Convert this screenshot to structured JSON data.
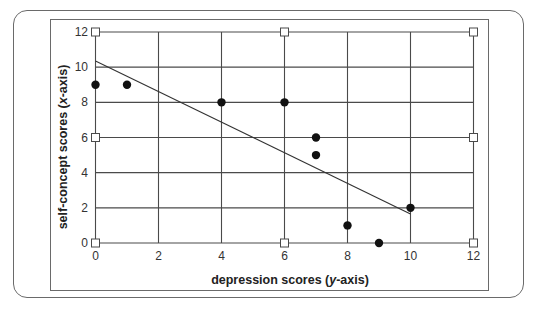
{
  "chart_data": {
    "type": "scatter",
    "title": "",
    "xlabel": "depression scores (y-axis)",
    "xlabel_parts": {
      "pre": "depression scores (",
      "italic": "y",
      "post": "-axis)"
    },
    "ylabel": "self-concept scores (x-axis)",
    "ylabel_parts": {
      "pre": "self-concept scores (",
      "italic": "x",
      "post": "-axis)"
    },
    "xlim": [
      0,
      12
    ],
    "ylim": [
      0,
      12
    ],
    "xticks": [
      0,
      2,
      4,
      6,
      8,
      10,
      12
    ],
    "yticks": [
      0,
      2,
      4,
      6,
      8,
      10,
      12
    ],
    "grid": true,
    "points": [
      {
        "x": 0,
        "y": 9
      },
      {
        "x": 1,
        "y": 9
      },
      {
        "x": 4,
        "y": 8
      },
      {
        "x": 6,
        "y": 8
      },
      {
        "x": 7,
        "y": 6
      },
      {
        "x": 7,
        "y": 5
      },
      {
        "x": 8,
        "y": 1
      },
      {
        "x": 9,
        "y": 0
      },
      {
        "x": 10,
        "y": 2
      }
    ],
    "regression_line": {
      "x1": 0,
      "y1": 10.35,
      "x2": 10,
      "y2": 1.65
    },
    "square_markers": [
      {
        "x": 0,
        "y": 0
      },
      {
        "x": 6,
        "y": 0
      },
      {
        "x": 12,
        "y": 0
      },
      {
        "x": 0,
        "y": 6
      },
      {
        "x": 12,
        "y": 6
      },
      {
        "x": 0,
        "y": 12
      },
      {
        "x": 6,
        "y": 12
      },
      {
        "x": 12,
        "y": 12
      }
    ],
    "legend": null
  },
  "colors": {
    "grid": "#4a4a4a",
    "points": "#111111",
    "line": "#333333",
    "frame": "#6a6a6a"
  }
}
